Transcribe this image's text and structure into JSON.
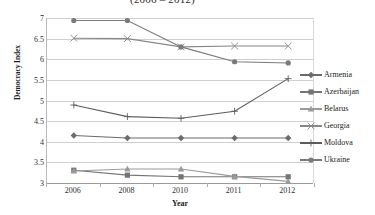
{
  "chart_data": {
    "type": "line",
    "title": "(2006 – 2012)",
    "xlabel": "Year",
    "ylabel": "Democracy Index",
    "categories": [
      "2006",
      "2008",
      "2010",
      "2011",
      "2012"
    ],
    "x": [
      2006,
      2008,
      2010,
      2011,
      2012
    ],
    "ylim": [
      3,
      7
    ],
    "yticks": [
      "3",
      "3.5",
      "4",
      "4.5",
      "5",
      "5.5",
      "6",
      "6.5",
      "7"
    ],
    "ytick_values": [
      3,
      3.5,
      4,
      4.5,
      5,
      5.5,
      6,
      6.5,
      7
    ],
    "grid": true,
    "legend_position": "right",
    "series": [
      {
        "name": "Armenia",
        "marker": "diamond",
        "color": "#6b6b6b",
        "values": [
          4.15,
          4.09,
          4.09,
          4.09,
          4.09
        ]
      },
      {
        "name": "Azerbaijan",
        "marker": "square",
        "color": "#757575",
        "values": [
          3.31,
          3.19,
          3.15,
          3.15,
          3.15
        ]
      },
      {
        "name": "Belarus",
        "marker": "triangle",
        "color": "#9a9a9a",
        "values": [
          3.29,
          3.34,
          3.34,
          3.16,
          3.04
        ]
      },
      {
        "name": "Georgia",
        "marker": "cross-x",
        "color": "#888888",
        "values": [
          6.51,
          6.5,
          6.3,
          6.32,
          6.32
        ]
      },
      {
        "name": "Moldova",
        "marker": "plus",
        "color": "#5d5d5d",
        "values": [
          4.89,
          4.61,
          4.57,
          4.74,
          5.53
        ]
      },
      {
        "name": "Ukraine",
        "marker": "circle",
        "color": "#7a7a7a",
        "values": [
          6.94,
          6.94,
          6.3,
          5.94,
          5.91
        ]
      }
    ]
  },
  "legend": {
    "items": [
      {
        "label": "Armenia"
      },
      {
        "label": "Azerbaijan"
      },
      {
        "label": "Belarus"
      },
      {
        "label": "Georgia"
      },
      {
        "label": "Moldova"
      },
      {
        "label": "Ukraine"
      }
    ]
  }
}
